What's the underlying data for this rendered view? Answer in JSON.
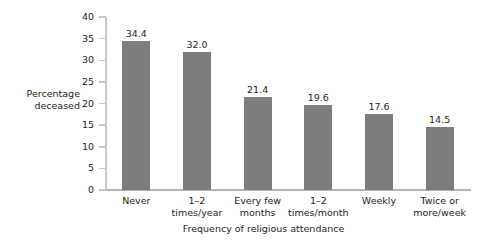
{
  "chart_data": {
    "type": "bar",
    "title": "",
    "subtitle": "",
    "xlabel": "Frequency of religious attendance",
    "ylabel": "Percentage\ndeceased",
    "categories": [
      "Never",
      "1–2\ntimes/year",
      "Every few\nmonths",
      "1–2\ntimes/month",
      "Weekly",
      "Twice or\nmore/week"
    ],
    "values": [
      34.4,
      32.0,
      21.4,
      19.6,
      17.6,
      14.5
    ],
    "value_labels": [
      "34.4",
      "32.0",
      "21.4",
      "19.6",
      "17.6",
      "14.5"
    ],
    "ylim": [
      0,
      40
    ],
    "yticks": [
      0,
      5,
      10,
      15,
      20,
      25,
      30,
      35,
      40
    ],
    "ytick_labels": [
      "0",
      "5",
      "10",
      "15",
      "20",
      "25",
      "30",
      "35",
      "40"
    ],
    "grid": false,
    "legend": null,
    "legend_position": "none",
    "bar_color": "#7d7d7d",
    "axis_color": "#c9c9c9",
    "background_color": "#ffffff",
    "text_color": "#231f20"
  }
}
